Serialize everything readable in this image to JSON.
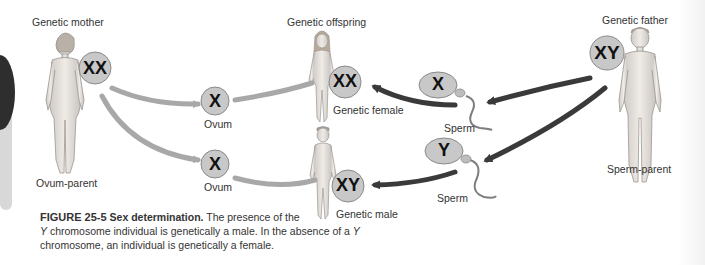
{
  "figure": {
    "labels": {
      "genetic_mother": "Genetic mother",
      "ovum_parent": "Ovum-parent",
      "genetic_offspring": "Genetic offspring",
      "genetic_female": "Genetic female",
      "genetic_male": "Genetic male",
      "genetic_father": "Genetic father",
      "sperm_parent": "Sperm-parent",
      "ovum_top": "Ovum",
      "ovum_bottom": "Ovum",
      "sperm_top": "Sperm",
      "sperm_bottom": "Sperm"
    },
    "chromosomes": {
      "mother": "XX",
      "father": "XY",
      "ovum_top": "X",
      "ovum_bottom": "X",
      "sperm_top": "X",
      "sperm_bottom": "Y",
      "female_offspring": "XX",
      "male_offspring": "XY"
    },
    "caption": {
      "figure_number": "FIGURE 25-5",
      "title": "Sex determination.",
      "text_1": " The presence of the ",
      "y1": "Y",
      "text_2": " chromosome individual is genetically a male. In the absence of a ",
      "y2": "Y",
      "text_3": " chromosome, an individual is genetically a female."
    },
    "colors": {
      "circle_fill": "#c8c8c8",
      "circle_stroke": "#8a8a8a",
      "maternal_arrow": "#a8a8a8",
      "paternal_arrow": "#3a3a3a",
      "body_fill": "#e6e2de",
      "body_stroke": "#9a9590",
      "tab_dark": "#2e2e2e",
      "tab_light": "#d8d8d8"
    }
  }
}
